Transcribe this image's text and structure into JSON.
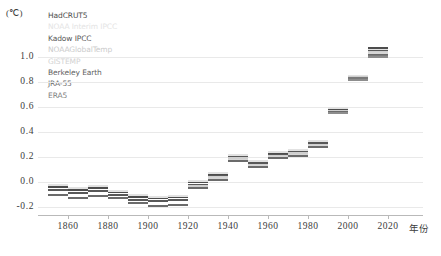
{
  "chart_data": {
    "type": "bar",
    "title": "",
    "xlabel": "年份",
    "ylabel": "(℃)",
    "ylim": [
      -0.25,
      1.15
    ],
    "xlim": [
      1848,
      2022
    ],
    "grid": true,
    "legend_position": "top-left-inside",
    "y_ticks": [
      "1.0",
      "0.8",
      "0.6",
      "0.4",
      "0.2",
      "0.0",
      "-0.2"
    ],
    "y_tick_values": [
      1.0,
      0.8,
      0.6,
      0.4,
      0.2,
      0.0,
      -0.2
    ],
    "x_ticks": [
      "1860",
      "1880",
      "1900",
      "1920",
      "1940",
      "1960",
      "1980",
      "2000",
      "2020"
    ],
    "x_tick_values": [
      1860,
      1880,
      1900,
      1920,
      1940,
      1960,
      1980,
      2000,
      2020
    ],
    "series": [
      {
        "name": "HadCRUT5",
        "color": "#4d4d4d"
      },
      {
        "name": "NOAA Interim IPCC",
        "color": "#e2e2e2"
      },
      {
        "name": "Kadow IPCC",
        "color": "#585858"
      },
      {
        "name": "NOAAGlobalTemp",
        "color": "#cfcfcf"
      },
      {
        "name": "GISTEMP",
        "color": "#d6d6d6"
      },
      {
        "name": "Berkeley Earth",
        "color": "#6b6b6b"
      },
      {
        "name": "JRA-55",
        "color": "#7a7a7a"
      },
      {
        "name": "ERA5",
        "color": "#8d8d8d"
      }
    ],
    "categories": [
      1850,
      1860,
      1870,
      1880,
      1890,
      1900,
      1910,
      1920,
      1930,
      1940,
      1950,
      1960,
      1970,
      1980,
      1990,
      2000,
      2010
    ],
    "decades": [
      {
        "decade": "1850s",
        "start": 1850,
        "values": [
          -0.04,
          -0.02,
          -0.06,
          null,
          null,
          -0.1,
          null,
          null
        ]
      },
      {
        "decade": "1860s",
        "start": 1860,
        "values": [
          -0.06,
          -0.05,
          -0.09,
          null,
          null,
          -0.13,
          null,
          null
        ]
      },
      {
        "decade": "1870s",
        "start": 1870,
        "values": [
          -0.05,
          -0.03,
          -0.07,
          null,
          null,
          -0.11,
          null,
          null
        ]
      },
      {
        "decade": "1880s",
        "start": 1880,
        "values": [
          -0.08,
          -0.07,
          -0.1,
          null,
          null,
          -0.13,
          null,
          null
        ]
      },
      {
        "decade": "1890s",
        "start": 1890,
        "values": [
          -0.12,
          -0.1,
          -0.14,
          null,
          null,
          -0.17,
          null,
          null
        ]
      },
      {
        "decade": "1900s",
        "start": 1900,
        "values": [
          -0.13,
          -0.12,
          -0.15,
          null,
          null,
          -0.19,
          null,
          null
        ]
      },
      {
        "decade": "1910s",
        "start": 1910,
        "values": [
          -0.12,
          -0.11,
          -0.14,
          null,
          null,
          -0.18,
          null,
          null
        ]
      },
      {
        "decade": "1920s",
        "start": 1920,
        "values": [
          0.0,
          0.01,
          -0.02,
          -0.03,
          null,
          -0.05,
          null,
          null
        ]
      },
      {
        "decade": "1930s",
        "start": 1930,
        "values": [
          0.06,
          0.07,
          0.05,
          0.04,
          0.03,
          0.02,
          null,
          null
        ]
      },
      {
        "decade": "1940s",
        "start": 1940,
        "values": [
          0.21,
          0.22,
          0.2,
          0.19,
          0.18,
          0.17,
          null,
          null
        ]
      },
      {
        "decade": "1950s",
        "start": 1950,
        "values": [
          0.16,
          0.17,
          0.15,
          0.14,
          0.13,
          0.12,
          null,
          null
        ]
      },
      {
        "decade": "1960s",
        "start": 1960,
        "values": [
          0.23,
          0.24,
          0.22,
          0.21,
          0.2,
          0.19,
          null,
          null
        ]
      },
      {
        "decade": "1970s",
        "start": 1970,
        "values": [
          0.25,
          0.26,
          0.24,
          0.23,
          0.22,
          0.21,
          null,
          null
        ]
      },
      {
        "decade": "1980s",
        "start": 1980,
        "values": [
          0.32,
          0.33,
          0.31,
          0.3,
          0.29,
          0.28,
          null,
          null
        ]
      },
      {
        "decade": "1990s",
        "start": 1990,
        "values": [
          0.58,
          0.59,
          0.57,
          0.57,
          0.56,
          0.56,
          0.55,
          0.55
        ]
      },
      {
        "decade": "2000s",
        "start": 2000,
        "values": [
          0.85,
          0.85,
          0.84,
          0.84,
          0.83,
          0.83,
          0.83,
          0.82
        ]
      },
      {
        "decade": "2010s",
        "start": 2010,
        "values": [
          1.07,
          1.06,
          1.05,
          1.04,
          1.03,
          1.02,
          1.01,
          1.0
        ]
      }
    ]
  },
  "legend": {
    "items": [
      {
        "label": "HadCRUT5",
        "color": "#4d4d4d"
      },
      {
        "label": "NOAA Interim IPCC",
        "color": "#e4e4e4"
      },
      {
        "label": "Kadow IPCC",
        "color": "#585858"
      },
      {
        "label": "NOAAGlobalTemp",
        "color": "#cbcbcb"
      },
      {
        "label": "GISTEMP",
        "color": "#d2d2d2"
      },
      {
        "label": "Berkeley Earth",
        "color": "#5f5f5f"
      },
      {
        "label": "JRA-55",
        "color": "#707070"
      },
      {
        "label": "ERA5",
        "color": "#7f7f7f"
      }
    ]
  },
  "axes": {
    "y_unit_label": "(℃)",
    "x_title": "年份"
  }
}
